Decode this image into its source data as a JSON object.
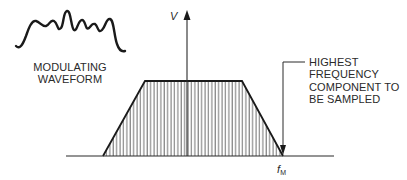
{
  "diagram": {
    "waveform_label": [
      "MODULATING",
      "WAVEFORM"
    ],
    "y_axis_label": "V",
    "x_marker_label": "f",
    "x_marker_subscript": "M",
    "annotation": [
      "HIGHEST",
      "FREQUENCY",
      "COMPONENT TO",
      "BE SAMPLED"
    ],
    "colors": {
      "line": "#1a1a1a",
      "hatch": "#3a3a3a",
      "background": "#ffffff"
    },
    "shape": "trapezoid-spectrum"
  }
}
